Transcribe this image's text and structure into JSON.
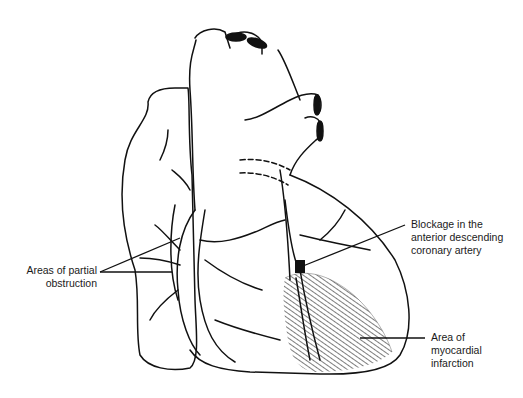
{
  "diagram": {
    "labels": {
      "partial_obstruction": {
        "line1": "Areas of partial",
        "line2": "obstruction"
      },
      "blockage": {
        "line1": "Blockage in the",
        "line2": "anterior descending",
        "line3": "coronary artery"
      },
      "infarction": {
        "line1": "Area of",
        "line2": "myocardial",
        "line3": "infarction"
      }
    },
    "colors": {
      "stroke": "#111111",
      "background": "#ffffff",
      "blockage_fill": "#111111"
    }
  }
}
